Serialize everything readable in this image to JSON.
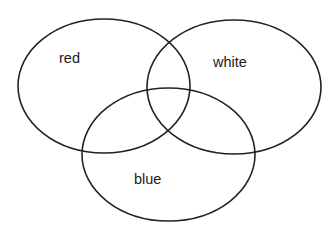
{
  "diagram": {
    "type": "venn",
    "set_count": 3,
    "line_color": "#222222",
    "background": "#ffffff",
    "sets": [
      {
        "id": "red",
        "label": "red",
        "ellipse": {
          "cx": 104,
          "cy": 86,
          "rx": 86,
          "ry": 67
        },
        "label_pos": {
          "x": 59,
          "y": 63
        }
      },
      {
        "id": "white",
        "label": "white",
        "ellipse": {
          "cx": 234,
          "cy": 87,
          "rx": 87,
          "ry": 67
        },
        "label_pos": {
          "x": 213,
          "y": 67
        }
      },
      {
        "id": "blue",
        "label": "blue",
        "ellipse": {
          "cx": 168.5,
          "cy": 154.5,
          "rx": 86.5,
          "ry": 66.5
        },
        "label_pos": {
          "x": 134,
          "y": 184
        }
      }
    ]
  }
}
